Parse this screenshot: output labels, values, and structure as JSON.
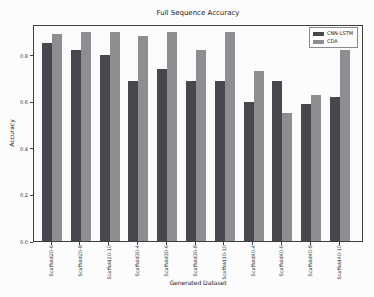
{
  "chart_data": {
    "type": "bar",
    "title": "Full Sequence Accuracy",
    "xlabel": "Generated Dataset",
    "ylabel": "Accuracy",
    "categories": [
      "Scaffold20-6",
      "Scaffold20-8",
      "Scaffold20-10",
      "Scaffold30-4",
      "Scaffold30-6",
      "Scaffold30-8",
      "Scaffold30-10",
      "Scaffold40-4",
      "Scaffold40-6",
      "Scaffold40-8",
      "Scaffold40-10"
    ],
    "series": [
      {
        "name": "CNN-LSTM",
        "color": "#47474d",
        "values": [
          0.85,
          0.82,
          0.8,
          0.69,
          0.74,
          0.69,
          0.69,
          0.6,
          0.69,
          0.59,
          0.62
        ]
      },
      {
        "name": "CDA",
        "color": "#8e8e92",
        "values": [
          0.89,
          0.9,
          0.9,
          0.88,
          0.9,
          0.82,
          0.9,
          0.73,
          0.55,
          0.63,
          0.82
        ]
      }
    ],
    "yticks": [
      "0.0",
      "0.2",
      "0.4",
      "0.6",
      "0.8"
    ],
    "ylim": [
      0,
      0.933
    ],
    "grid": false,
    "legend_position": "upper right"
  }
}
